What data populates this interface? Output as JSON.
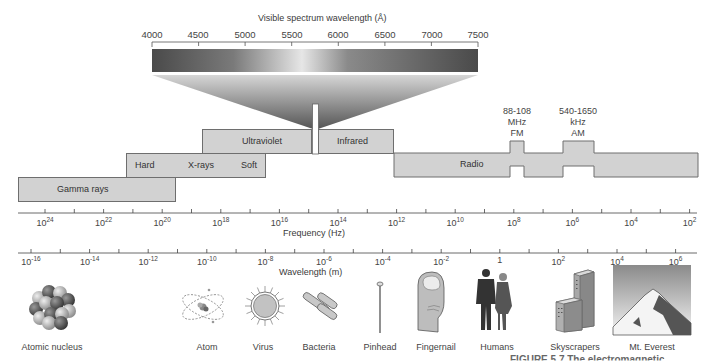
{
  "visible_spectrum": {
    "title": "Visible spectrum wavelength (Å)",
    "ticks": [
      "4000",
      "4500",
      "5000",
      "5500",
      "6000",
      "6500",
      "7000",
      "7500"
    ]
  },
  "bands": {
    "gamma": "Gamma rays",
    "xray_hard": "Hard",
    "xray": "X-rays",
    "xray_soft": "Soft",
    "ultraviolet": "Ultraviolet",
    "infrared": "Infrared",
    "radio": "Radio",
    "fm": {
      "range": "88-108",
      "unit": "MHz",
      "name": "FM"
    },
    "am": {
      "range": "540-1650",
      "unit": "kHz",
      "name": "AM"
    }
  },
  "frequency_axis": {
    "label": "Frequency (Hz)",
    "ticks": [
      {
        "base": "10",
        "exp": "24"
      },
      {
        "base": "10",
        "exp": "22"
      },
      {
        "base": "10",
        "exp": "20"
      },
      {
        "base": "10",
        "exp": "18"
      },
      {
        "base": "10",
        "exp": "16"
      },
      {
        "base": "10",
        "exp": "14"
      },
      {
        "base": "10",
        "exp": "12"
      },
      {
        "base": "10",
        "exp": "10"
      },
      {
        "base": "10",
        "exp": "8"
      },
      {
        "base": "10",
        "exp": "6"
      },
      {
        "base": "10",
        "exp": "4"
      },
      {
        "base": "10",
        "exp": "2"
      }
    ]
  },
  "wavelength_axis": {
    "label": "Wavelength (m)",
    "ticks": [
      {
        "base": "10",
        "exp": "-16"
      },
      {
        "base": "10",
        "exp": "-14"
      },
      {
        "base": "10",
        "exp": "-12"
      },
      {
        "base": "10",
        "exp": "-10"
      },
      {
        "base": "10",
        "exp": "-8"
      },
      {
        "base": "10",
        "exp": "-6"
      },
      {
        "base": "10",
        "exp": "-4"
      },
      {
        "base": "10",
        "exp": "-2"
      },
      {
        "base": "1",
        "exp": ""
      },
      {
        "base": "10",
        "exp": "2"
      },
      {
        "base": "10",
        "exp": "4"
      },
      {
        "base": "10",
        "exp": "6"
      }
    ]
  },
  "objects": [
    {
      "label": "Atomic nucleus",
      "icon": "atomic-nucleus-icon"
    },
    {
      "label": "Atom",
      "icon": "atom-icon"
    },
    {
      "label": "Virus",
      "icon": "virus-icon"
    },
    {
      "label": "Bacteria",
      "icon": "bacteria-icon"
    },
    {
      "label": "Pinhead",
      "icon": "pinhead-icon"
    },
    {
      "label": "Fingernail",
      "icon": "fingernail-icon"
    },
    {
      "label": "Humans",
      "icon": "humans-icon"
    },
    {
      "label": "Skyscrapers",
      "icon": "skyscrapers-icon"
    },
    {
      "label": "Mt. Everest",
      "icon": "mountain-icon"
    }
  ],
  "caption_fragment": "FIGURE 5.7 The electromagnetic"
}
